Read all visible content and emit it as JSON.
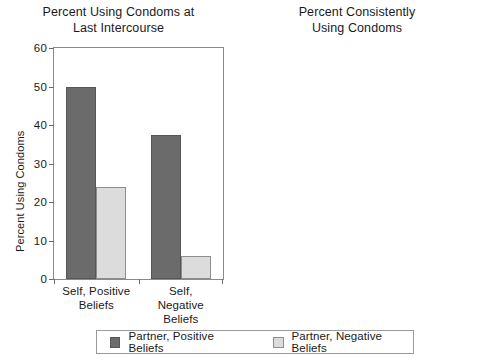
{
  "chart_data": [
    {
      "type": "bar",
      "panel": "left",
      "title": "Percent Using Condoms at\nLast Intercourse",
      "xlabel": "",
      "ylabel": "Percent Using Condoms",
      "ylim": [
        0,
        60
      ],
      "yticks": [
        0,
        10,
        20,
        30,
        40,
        50,
        60
      ],
      "ytick_labels": [
        "0",
        "10",
        "20",
        "30",
        "40",
        "50",
        "60"
      ],
      "grid": false,
      "legend_position": "bottom",
      "categories": [
        "Self, Positive\nBeliefs",
        "Self, Negative\nBeliefs"
      ],
      "series": [
        {
          "name": "Partner, Positive Beliefs",
          "color": "#6b6b6b",
          "values": [
            50,
            37.5
          ]
        },
        {
          "name": "Partner, Negative Beliefs",
          "color": "#dcdcdc",
          "values": [
            24,
            6
          ]
        }
      ]
    },
    {
      "type": "bar",
      "panel": "right",
      "title": "Percent Consistently\nUsing Condoms",
      "xlabel": "",
      "ylabel": "Percent Consistently Using Condoms",
      "ylim": [
        0,
        50
      ],
      "yticks": [
        0,
        10,
        20,
        30,
        40,
        50
      ],
      "ytick_labels": [
        "0",
        "10",
        "20",
        "30",
        "40",
        "50"
      ],
      "grid": false,
      "legend_position": "bottom",
      "categories": [
        "Self, Positive\nBeliefs",
        "Self, Negative\nBeliefs"
      ],
      "series": [
        {
          "name": "Partner, Positive Beliefs",
          "color": "#6b6b6b",
          "values": [
            42.5,
            40
          ]
        },
        {
          "name": "Partner, Negative Beliefs",
          "color": "#dcdcdc",
          "values": [
            21,
            8.5
          ]
        }
      ]
    }
  ],
  "legend": {
    "entries": [
      {
        "label": "Partner, Positive Beliefs",
        "color": "#6b6b6b"
      },
      {
        "label": "Partner, Negative Beliefs",
        "color": "#dcdcdc"
      }
    ]
  }
}
